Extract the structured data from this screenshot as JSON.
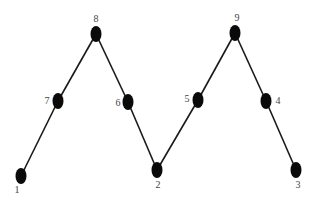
{
  "diagram": {
    "type": "path-graph",
    "colors": {
      "background": "#ffffff",
      "node": "#0a0a0a",
      "edge": "#1a1a1a",
      "label": "#444444"
    },
    "nodes": [
      {
        "id": "1",
        "label": "1",
        "x": 21,
        "y": 176,
        "label_x": 17,
        "label_y": 193
      },
      {
        "id": "2",
        "label": "2",
        "x": 157,
        "y": 170,
        "label_x": 158,
        "label_y": 188
      },
      {
        "id": "3",
        "label": "3",
        "x": 296,
        "y": 170,
        "label_x": 298,
        "label_y": 188
      },
      {
        "id": "4",
        "label": "4",
        "x": 266,
        "y": 101,
        "label_x": 278,
        "label_y": 104
      },
      {
        "id": "5",
        "label": "5",
        "x": 198,
        "y": 100,
        "label_x": 187,
        "label_y": 102
      },
      {
        "id": "6",
        "label": "6",
        "x": 128,
        "y": 102,
        "label_x": 118,
        "label_y": 106
      },
      {
        "id": "7",
        "label": "7",
        "x": 58,
        "y": 101,
        "label_x": 47,
        "label_y": 104
      },
      {
        "id": "8",
        "label": "8",
        "x": 96,
        "y": 34,
        "label_x": 96,
        "label_y": 22
      },
      {
        "id": "9",
        "label": "9",
        "x": 235,
        "y": 33,
        "label_x": 237,
        "label_y": 21
      }
    ],
    "edges": [
      {
        "from": "1",
        "to": "7"
      },
      {
        "from": "7",
        "to": "8"
      },
      {
        "from": "8",
        "to": "6"
      },
      {
        "from": "6",
        "to": "2"
      },
      {
        "from": "2",
        "to": "5"
      },
      {
        "from": "5",
        "to": "9"
      },
      {
        "from": "9",
        "to": "4"
      },
      {
        "from": "4",
        "to": "3"
      }
    ]
  }
}
